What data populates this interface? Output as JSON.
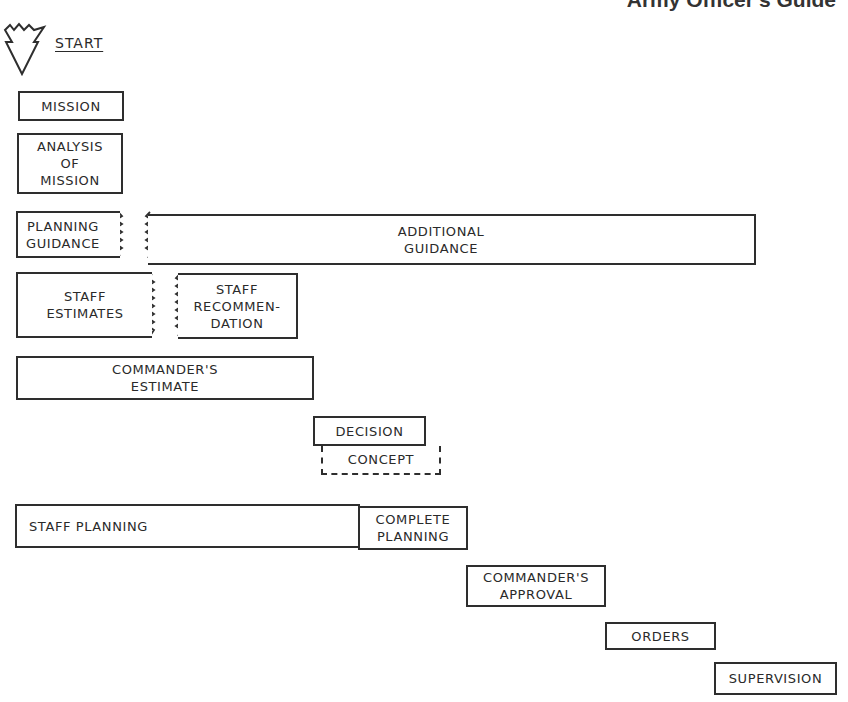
{
  "header": {
    "title": "Army Officer's Guide"
  },
  "start": {
    "label": "START",
    "icon": "start-triangle-icon"
  },
  "steps": {
    "mission": "MISSION",
    "analysis": "ANALYSIS\nOF\nMISSION",
    "planning_guidance": "PLANNING\nGUIDANCE",
    "additional_guidance": "ADDITIONAL\nGUIDANCE",
    "staff_estimates": "STAFF\nESTIMATES",
    "staff_recommendation": "STAFF\nRECOMMEN-\nDATION",
    "commanders_estimate": "COMMANDER'S\nESTIMATE",
    "decision": "DECISION",
    "concept": "CONCEPT",
    "staff_planning": "STAFF PLANNING",
    "complete_planning": "COMPLETE\nPLANNING",
    "commanders_approval": "COMMANDER'S\nAPPROVAL",
    "orders": "ORDERS",
    "supervision": "SUPERVISION"
  }
}
